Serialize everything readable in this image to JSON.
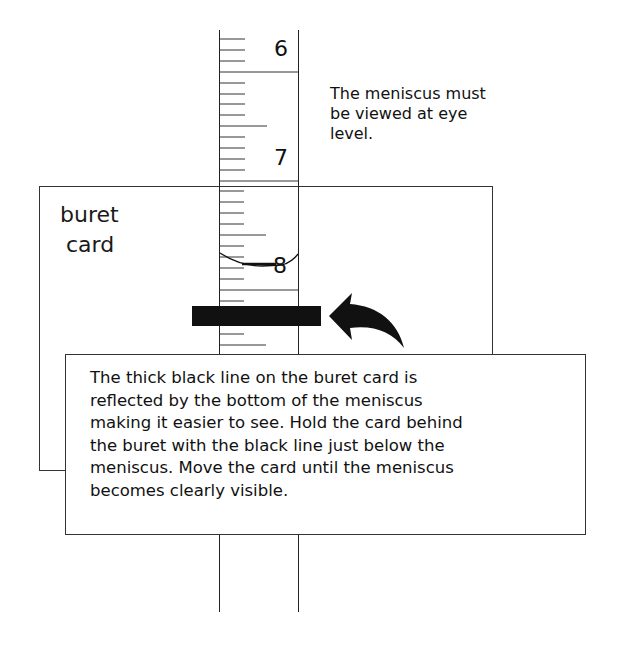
{
  "diagram": {
    "buret": {
      "scale_labels": [
        "6",
        "7",
        "8"
      ],
      "unit_note": "graduated in 0.1 mL ticks"
    },
    "card": {
      "label_line1": "buret",
      "label_line2": "card"
    },
    "eye_level_note": "The meniscus must be viewed at eye level.",
    "eye_level_lines": [
      "The meniscus must",
      "be viewed at eye",
      "level."
    ],
    "explanation_lines": [
      "The thick black line on the buret card is",
      "reflected by the bottom of the meniscus",
      "making it easier to see.  Hold the card behind",
      "the buret with the black line just below the",
      "meniscus.  Move the card until the meniscus",
      "becomes clearly visible."
    ],
    "colors": {
      "ink": "#111111",
      "background": "#ffffff"
    }
  }
}
